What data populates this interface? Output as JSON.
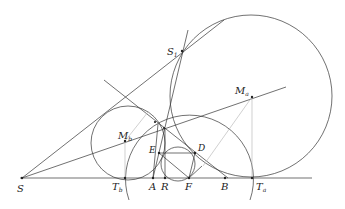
{
  "diagram": {
    "type": "geometry-construction",
    "labels": {
      "S": "S",
      "S1": "S",
      "S1_sub": "1",
      "Ma": "M",
      "Ma_sub": "a",
      "Mb": "M",
      "Mb_sub": "b",
      "E": "E",
      "D": "D",
      "Tb": "T",
      "Tb_sub": "b",
      "A": "A",
      "R": "R",
      "F": "F",
      "B": "B",
      "Ta": "T",
      "Ta_sub": "a"
    },
    "points": {
      "S": [
        22,
        178
      ],
      "S1": [
        182,
        51
      ],
      "Ma": [
        252,
        97
      ],
      "Mb": [
        125,
        141
      ],
      "E": [
        159,
        153
      ],
      "D": [
        195,
        153
      ],
      "Tb": [
        125,
        178
      ],
      "A": [
        153,
        178
      ],
      "R": [
        165,
        178
      ],
      "F": [
        189,
        178
      ],
      "B": [
        225,
        178
      ],
      "Ta": [
        252,
        178
      ]
    },
    "colors": {
      "line": "#333333",
      "light_line": "#bbbbbb"
    }
  }
}
